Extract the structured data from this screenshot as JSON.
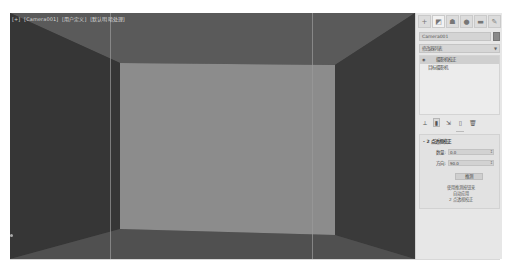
{
  "viewport": {
    "label_parts": [
      "[+]",
      "[Camera001]",
      "[用户定义]",
      "[默认明暗处理]"
    ],
    "scene": {
      "ceiling_color": "#5a5a5a",
      "floor_color": "#505050",
      "left_wall_color": "#363636",
      "right_wall_color": "#3a3a3a",
      "back_wall_color": "#8c8c8c"
    }
  },
  "command_panel": {
    "tabs": [
      {
        "name": "create",
        "glyph": "+"
      },
      {
        "name": "modify",
        "glyph": "◩"
      },
      {
        "name": "hierarchy",
        "glyph": "☗"
      },
      {
        "name": "motion",
        "glyph": "●"
      },
      {
        "name": "display",
        "glyph": "▬"
      },
      {
        "name": "utilities",
        "glyph": "✎"
      }
    ],
    "object_name": "Camera001",
    "modifier_list_label": "修改器列表",
    "stack": [
      {
        "label": "摄影机校正",
        "selected": true,
        "eye": "◉"
      },
      {
        "label": "目标摄影机",
        "selected": false
      }
    ],
    "stack_tools": [
      "⟂",
      "▮",
      "⇲",
      "▯",
      "🗑"
    ],
    "rollout": {
      "title": "- 2 点透视校正",
      "amount_label": "数量:",
      "amount_value": "0.0",
      "direction_label": "方向:",
      "direction_value": "90.0",
      "guess_button": "推测",
      "hint_lines": [
        "使用推测按钮来",
        "自动应用",
        "2 点透视校正"
      ]
    }
  }
}
